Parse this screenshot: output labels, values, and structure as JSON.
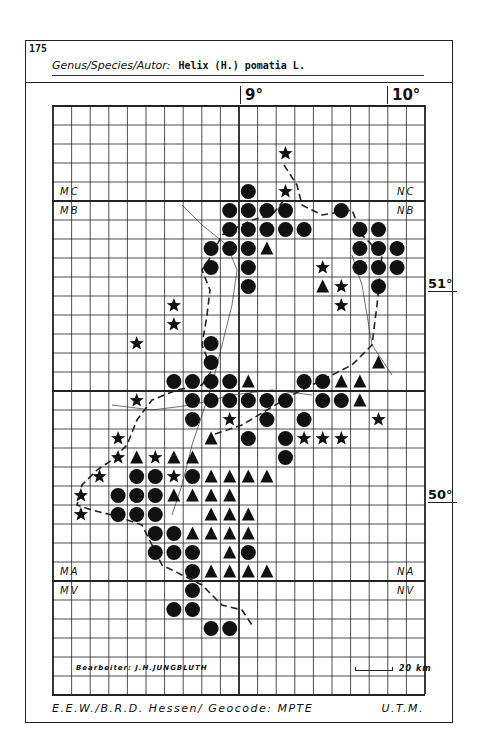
{
  "header": {
    "map_number": "175",
    "title_label": "Genus/Species/Autor:",
    "title_value": "Helix (H.) pomatia L."
  },
  "axes": {
    "longitude_labels": [
      {
        "label": "9°",
        "col": 10
      },
      {
        "label": "10°",
        "col": 18
      }
    ],
    "latitude_labels": [
      {
        "label": "51°",
        "y": 276
      },
      {
        "label": "50°",
        "y": 487
      }
    ]
  },
  "grid": {
    "cols": 20,
    "rows": 31,
    "cell_w": 18.6,
    "cell_h": 19,
    "thick_vertical_cols": [
      10
    ],
    "thick_horizontal_rows": [
      5,
      15,
      25
    ]
  },
  "zones": [
    {
      "label": "MC",
      "x": 60,
      "y": 186
    },
    {
      "label": "MB",
      "x": 60,
      "y": 205
    },
    {
      "label": "NC",
      "x": 397,
      "y": 186
    },
    {
      "label": "NB",
      "x": 397,
      "y": 205
    },
    {
      "label": "MA",
      "x": 60,
      "y": 566
    },
    {
      "label": "MV",
      "x": 60,
      "y": 585
    },
    {
      "label": "NA",
      "x": 397,
      "y": 566
    },
    {
      "label": "NV",
      "x": 397,
      "y": 585
    }
  ],
  "legend": {
    "circle": "circle-marker",
    "triangle": "triangle-marker",
    "star": "star-marker"
  },
  "markers": [
    {
      "c": 12,
      "r": 2,
      "t": "s"
    },
    {
      "c": 10,
      "r": 4,
      "t": "c"
    },
    {
      "c": 12,
      "r": 4,
      "t": "s"
    },
    {
      "c": 9,
      "r": 5,
      "t": "c"
    },
    {
      "c": 10,
      "r": 5,
      "t": "c"
    },
    {
      "c": 11,
      "r": 5,
      "t": "c"
    },
    {
      "c": 12,
      "r": 5,
      "t": "c"
    },
    {
      "c": 15,
      "r": 5,
      "t": "c"
    },
    {
      "c": 9,
      "r": 6,
      "t": "c"
    },
    {
      "c": 10,
      "r": 6,
      "t": "c"
    },
    {
      "c": 11,
      "r": 6,
      "t": "c"
    },
    {
      "c": 12,
      "r": 6,
      "t": "c"
    },
    {
      "c": 13,
      "r": 6,
      "t": "c"
    },
    {
      "c": 16,
      "r": 6,
      "t": "c"
    },
    {
      "c": 17,
      "r": 6,
      "t": "c"
    },
    {
      "c": 8,
      "r": 7,
      "t": "c"
    },
    {
      "c": 9,
      "r": 7,
      "t": "c"
    },
    {
      "c": 10,
      "r": 7,
      "t": "c"
    },
    {
      "c": 11,
      "r": 7,
      "t": "t"
    },
    {
      "c": 16,
      "r": 7,
      "t": "c"
    },
    {
      "c": 17,
      "r": 7,
      "t": "c"
    },
    {
      "c": 18,
      "r": 7,
      "t": "c"
    },
    {
      "c": 8,
      "r": 8,
      "t": "c"
    },
    {
      "c": 10,
      "r": 8,
      "t": "c"
    },
    {
      "c": 14,
      "r": 8,
      "t": "s"
    },
    {
      "c": 16,
      "r": 8,
      "t": "c"
    },
    {
      "c": 17,
      "r": 8,
      "t": "c"
    },
    {
      "c": 18,
      "r": 8,
      "t": "c"
    },
    {
      "c": 10,
      "r": 9,
      "t": "c"
    },
    {
      "c": 14,
      "r": 9,
      "t": "t"
    },
    {
      "c": 15,
      "r": 9,
      "t": "s"
    },
    {
      "c": 17,
      "r": 9,
      "t": "c"
    },
    {
      "c": 6,
      "r": 10,
      "t": "s"
    },
    {
      "c": 15,
      "r": 10,
      "t": "s"
    },
    {
      "c": 6,
      "r": 11,
      "t": "s"
    },
    {
      "c": 4,
      "r": 12,
      "t": "s"
    },
    {
      "c": 8,
      "r": 12,
      "t": "c"
    },
    {
      "c": 8,
      "r": 13,
      "t": "c"
    },
    {
      "c": 17,
      "r": 13,
      "t": "t"
    },
    {
      "c": 6,
      "r": 14,
      "t": "c"
    },
    {
      "c": 7,
      "r": 14,
      "t": "c"
    },
    {
      "c": 8,
      "r": 14,
      "t": "c"
    },
    {
      "c": 9,
      "r": 14,
      "t": "c"
    },
    {
      "c": 10,
      "r": 14,
      "t": "t"
    },
    {
      "c": 13,
      "r": 14,
      "t": "c"
    },
    {
      "c": 14,
      "r": 14,
      "t": "c"
    },
    {
      "c": 15,
      "r": 14,
      "t": "t"
    },
    {
      "c": 16,
      "r": 14,
      "t": "t"
    },
    {
      "c": 4,
      "r": 15,
      "t": "s"
    },
    {
      "c": 7,
      "r": 15,
      "t": "c"
    },
    {
      "c": 8,
      "r": 15,
      "t": "c"
    },
    {
      "c": 9,
      "r": 15,
      "t": "c"
    },
    {
      "c": 10,
      "r": 15,
      "t": "c"
    },
    {
      "c": 11,
      "r": 15,
      "t": "c"
    },
    {
      "c": 12,
      "r": 15,
      "t": "c"
    },
    {
      "c": 14,
      "r": 15,
      "t": "c"
    },
    {
      "c": 15,
      "r": 15,
      "t": "c"
    },
    {
      "c": 16,
      "r": 15,
      "t": "t"
    },
    {
      "c": 7,
      "r": 16,
      "t": "c"
    },
    {
      "c": 9,
      "r": 16,
      "t": "s"
    },
    {
      "c": 11,
      "r": 16,
      "t": "c"
    },
    {
      "c": 13,
      "r": 16,
      "t": "c"
    },
    {
      "c": 17,
      "r": 16,
      "t": "s"
    },
    {
      "c": 3,
      "r": 17,
      "t": "s"
    },
    {
      "c": 8,
      "r": 17,
      "t": "t"
    },
    {
      "c": 10,
      "r": 17,
      "t": "c"
    },
    {
      "c": 12,
      "r": 17,
      "t": "c"
    },
    {
      "c": 13,
      "r": 17,
      "t": "s"
    },
    {
      "c": 14,
      "r": 17,
      "t": "s"
    },
    {
      "c": 15,
      "r": 17,
      "t": "s"
    },
    {
      "c": 3,
      "r": 18,
      "t": "s"
    },
    {
      "c": 4,
      "r": 18,
      "t": "t"
    },
    {
      "c": 5,
      "r": 18,
      "t": "s"
    },
    {
      "c": 6,
      "r": 18,
      "t": "t"
    },
    {
      "c": 7,
      "r": 18,
      "t": "t"
    },
    {
      "c": 12,
      "r": 18,
      "t": "c"
    },
    {
      "c": 2,
      "r": 19,
      "t": "s"
    },
    {
      "c": 4,
      "r": 19,
      "t": "c"
    },
    {
      "c": 5,
      "r": 19,
      "t": "c"
    },
    {
      "c": 6,
      "r": 19,
      "t": "s"
    },
    {
      "c": 7,
      "r": 19,
      "t": "c"
    },
    {
      "c": 8,
      "r": 19,
      "t": "t"
    },
    {
      "c": 9,
      "r": 19,
      "t": "t"
    },
    {
      "c": 10,
      "r": 19,
      "t": "t"
    },
    {
      "c": 11,
      "r": 19,
      "t": "t"
    },
    {
      "c": 1,
      "r": 20,
      "t": "s"
    },
    {
      "c": 3,
      "r": 20,
      "t": "c"
    },
    {
      "c": 4,
      "r": 20,
      "t": "c"
    },
    {
      "c": 5,
      "r": 20,
      "t": "c"
    },
    {
      "c": 6,
      "r": 20,
      "t": "t"
    },
    {
      "c": 7,
      "r": 20,
      "t": "t"
    },
    {
      "c": 8,
      "r": 20,
      "t": "t"
    },
    {
      "c": 9,
      "r": 20,
      "t": "t"
    },
    {
      "c": 1,
      "r": 21,
      "t": "s"
    },
    {
      "c": 3,
      "r": 21,
      "t": "c"
    },
    {
      "c": 4,
      "r": 21,
      "t": "c"
    },
    {
      "c": 5,
      "r": 21,
      "t": "c"
    },
    {
      "c": 8,
      "r": 21,
      "t": "t"
    },
    {
      "c": 9,
      "r": 21,
      "t": "t"
    },
    {
      "c": 10,
      "r": 21,
      "t": "t"
    },
    {
      "c": 5,
      "r": 22,
      "t": "c"
    },
    {
      "c": 6,
      "r": 22,
      "t": "c"
    },
    {
      "c": 7,
      "r": 22,
      "t": "t"
    },
    {
      "c": 8,
      "r": 22,
      "t": "t"
    },
    {
      "c": 9,
      "r": 22,
      "t": "t"
    },
    {
      "c": 10,
      "r": 22,
      "t": "t"
    },
    {
      "c": 5,
      "r": 23,
      "t": "c"
    },
    {
      "c": 6,
      "r": 23,
      "t": "c"
    },
    {
      "c": 7,
      "r": 23,
      "t": "c"
    },
    {
      "c": 9,
      "r": 23,
      "t": "t"
    },
    {
      "c": 10,
      "r": 23,
      "t": "c"
    },
    {
      "c": 7,
      "r": 24,
      "t": "c"
    },
    {
      "c": 8,
      "r": 24,
      "t": "t"
    },
    {
      "c": 9,
      "r": 24,
      "t": "t"
    },
    {
      "c": 10,
      "r": 24,
      "t": "t"
    },
    {
      "c": 11,
      "r": 24,
      "t": "t"
    },
    {
      "c": 7,
      "r": 25,
      "t": "c"
    },
    {
      "c": 6,
      "r": 26,
      "t": "c"
    },
    {
      "c": 7,
      "r": 26,
      "t": "c"
    },
    {
      "c": 8,
      "r": 27,
      "t": "c"
    },
    {
      "c": 9,
      "r": 27,
      "t": "c"
    }
  ],
  "editor": "Bearbeiter: J.H.JUNGBLUTH",
  "scale_label": "20 km",
  "footer": {
    "left": "E.E.W./B.R.D. Hessen/ Geocode: MPTE",
    "right": "U.T.M."
  }
}
